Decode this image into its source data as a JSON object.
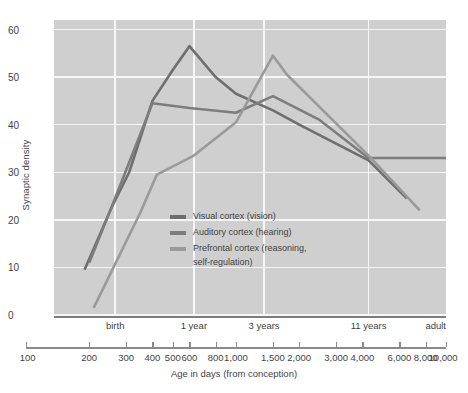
{
  "chart_data": {
    "type": "line",
    "title": "",
    "xlabel": "Age in days (from conception)",
    "ylabel": "Synaptic density",
    "xscale": "log",
    "xlim": [
      100,
      10000
    ],
    "ylim": [
      0,
      62
    ],
    "grid": true,
    "legend_position": "inside-left",
    "y_ticks": [
      0,
      10,
      20,
      30,
      40,
      50,
      60
    ],
    "x_tick_labels": [
      "100",
      "200",
      "300",
      "400",
      "500",
      "600",
      "800",
      "1,000",
      "1,500",
      "2,000",
      "3,000",
      "4,000",
      "6,000",
      "8,000",
      "10,000"
    ],
    "x_tick_values": [
      100,
      200,
      300,
      400,
      500,
      600,
      800,
      1000,
      1500,
      2000,
      3000,
      4000,
      6000,
      8000,
      10000
    ],
    "x_category_labels": [
      {
        "label": "birth",
        "value": 266
      },
      {
        "label": "1 year",
        "value": 630
      },
      {
        "label": "3 years",
        "value": 1360
      },
      {
        "label": "11 years",
        "value": 4280
      },
      {
        "label": "adult",
        "value": 10000
      }
    ],
    "x_gridlines": [
      266,
      630,
      1360,
      4280
    ],
    "series": [
      {
        "name": "Visual cortex (vision)",
        "color": "#6e6e6e",
        "points": [
          {
            "x": 190,
            "y": 9.5
          },
          {
            "x": 255,
            "y": 22.5
          },
          {
            "x": 310,
            "y": 30.0
          },
          {
            "x": 400,
            "y": 45.0
          },
          {
            "x": 500,
            "y": 51.5
          },
          {
            "x": 600,
            "y": 56.5
          },
          {
            "x": 800,
            "y": 50.0
          },
          {
            "x": 1000,
            "y": 46.5
          },
          {
            "x": 1500,
            "y": 43.0
          },
          {
            "x": 2000,
            "y": 40.0
          },
          {
            "x": 4280,
            "y": 32.5
          },
          {
            "x": 6500,
            "y": 24.5
          }
        ]
      },
      {
        "name": "Auditory cortex (hearing)",
        "color": "#7d7d7d",
        "points": [
          {
            "x": 200,
            "y": 11.0
          },
          {
            "x": 260,
            "y": 23.5
          },
          {
            "x": 400,
            "y": 44.5
          },
          {
            "x": 600,
            "y": 43.5
          },
          {
            "x": 1000,
            "y": 42.5
          },
          {
            "x": 1500,
            "y": 46.0
          },
          {
            "x": 2500,
            "y": 41.0
          },
          {
            "x": 4280,
            "y": 33.0
          },
          {
            "x": 10000,
            "y": 33.0
          }
        ]
      },
      {
        "name": "Prefrontal cortex (reasoning, self-regulation)",
        "color": "#9a9a9a",
        "points": [
          {
            "x": 210,
            "y": 1.5
          },
          {
            "x": 350,
            "y": 21.5
          },
          {
            "x": 420,
            "y": 29.5
          },
          {
            "x": 630,
            "y": 33.5
          },
          {
            "x": 1000,
            "y": 40.5
          },
          {
            "x": 1500,
            "y": 54.5
          },
          {
            "x": 1750,
            "y": 50.5
          },
          {
            "x": 4280,
            "y": 33.5
          },
          {
            "x": 7500,
            "y": 22.0
          }
        ]
      }
    ]
  },
  "legend": {
    "items": [
      {
        "label": "Visual cortex (vision)"
      },
      {
        "label": "Auditory cortex (hearing)"
      },
      {
        "label": "Prefrontal cortex (reasoning,\nself-regulation)"
      }
    ]
  },
  "axes": {
    "y_title": "Synaptic density",
    "x_title": "Age in days (from conception)"
  }
}
